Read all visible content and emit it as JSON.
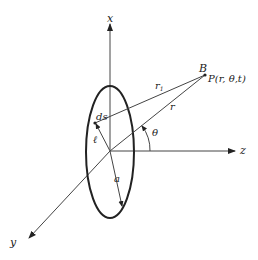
{
  "diagram": {
    "axes": {
      "x": {
        "label": "x"
      },
      "y": {
        "label": "y"
      },
      "z": {
        "label": "z"
      }
    },
    "point": {
      "label_B": "B",
      "label_P": "P(r, θ,t)"
    },
    "element": {
      "label": "ds"
    },
    "segments": {
      "r1": "r",
      "r1_sub": "1",
      "r": "r",
      "a": "a",
      "ell": "ℓ"
    },
    "angle": {
      "label": "θ"
    },
    "colors": {
      "stroke": "#444444",
      "loop": "#222222",
      "text": "#222222"
    }
  }
}
